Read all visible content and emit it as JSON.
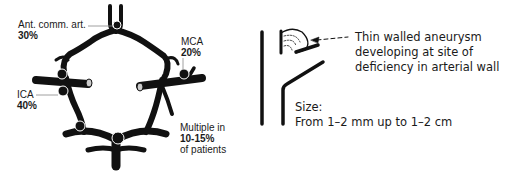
{
  "left_diagram": {
    "title": "Circle of Willis aneurysm sites",
    "labels": [
      {
        "id": "acom",
        "name": "Ant. comm. art.",
        "value": "30%"
      },
      {
        "id": "mca",
        "name": "MCA",
        "value": "20%"
      },
      {
        "id": "ica",
        "name": "ICA",
        "value": "40%"
      },
      {
        "id": "multiple",
        "line1": "Multiple in",
        "value": "10-15%",
        "line3": "of patients"
      }
    ]
  },
  "right_diagram": {
    "annotation_lines": [
      "Thin walled aneurysm",
      "developing at site of",
      "deficiency in arterial wall"
    ],
    "size_label": "Size:",
    "size_value": "From 1–2 mm up to 1–2 cm"
  },
  "colors": {
    "ink": "#111111",
    "text": "#1a1a1a",
    "background": "#ffffff",
    "leader": "#888888"
  }
}
